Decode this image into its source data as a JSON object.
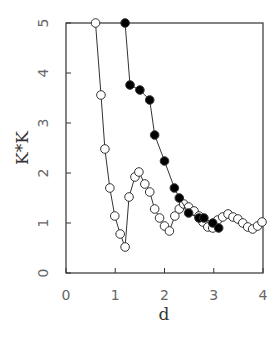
{
  "chart_data": {
    "type": "line",
    "title": "",
    "xlabel": "d",
    "ylabel": "K*K",
    "xlim": [
      0,
      4
    ],
    "ylim": [
      0,
      5
    ],
    "x_ticks": [
      "0",
      "1",
      "2",
      "3",
      "4"
    ],
    "y_ticks": [
      "0",
      "1",
      "2",
      "3",
      "4",
      "5"
    ],
    "grid": false,
    "legend": null,
    "series": [
      {
        "name": "open circles",
        "marker": "open-circle",
        "x": [
          0.6,
          0.71,
          0.79,
          0.89,
          0.99,
          1.1,
          1.2,
          1.28,
          1.4,
          1.48,
          1.6,
          1.7,
          1.8,
          1.9,
          2.0,
          2.1,
          2.21,
          2.3,
          2.39,
          2.49,
          2.6,
          2.7,
          2.78,
          2.88,
          2.98,
          3.08,
          3.18,
          3.29,
          3.39,
          3.49,
          3.59,
          3.69,
          3.79,
          3.89,
          3.98
        ],
        "y": [
          5.0,
          3.56,
          2.48,
          1.7,
          1.14,
          0.78,
          0.52,
          1.52,
          1.92,
          2.02,
          1.78,
          1.62,
          1.28,
          1.1,
          0.94,
          0.84,
          1.14,
          1.28,
          1.38,
          1.32,
          1.24,
          1.14,
          1.02,
          0.92,
          0.9,
          1.06,
          1.12,
          1.18,
          1.12,
          1.08,
          1.0,
          0.92,
          0.88,
          0.94,
          1.02
        ]
      },
      {
        "name": "filled circles",
        "marker": "filled-circle",
        "x": [
          1.2,
          1.3,
          1.5,
          1.7,
          1.8,
          2.0,
          2.2,
          2.3,
          2.49,
          2.7,
          2.8,
          2.98,
          3.1
        ],
        "y": [
          5.0,
          3.76,
          3.66,
          3.46,
          2.76,
          2.24,
          1.7,
          1.5,
          1.2,
          1.1,
          1.1,
          1.0,
          0.9
        ]
      }
    ]
  }
}
